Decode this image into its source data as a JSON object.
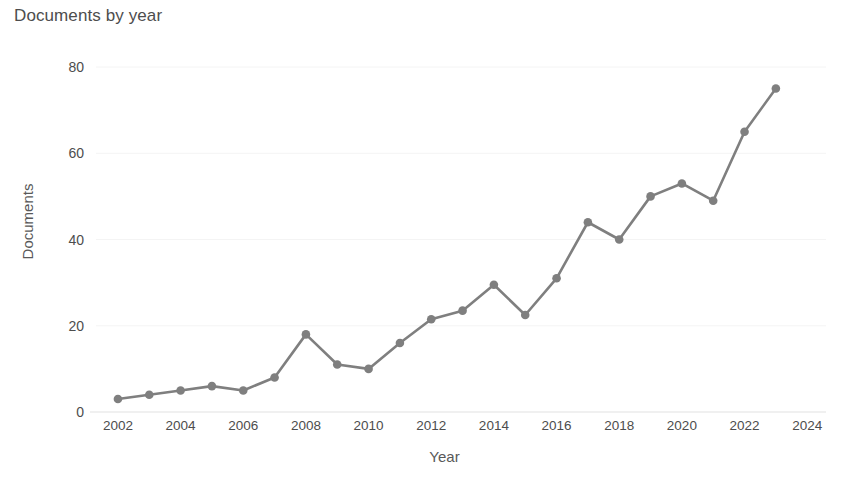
{
  "chart_data": {
    "type": "line",
    "title": "Documents by year",
    "xlabel": "Year",
    "ylabel": "Documents",
    "x": [
      2002,
      2003,
      2004,
      2005,
      2006,
      2007,
      2008,
      2009,
      2010,
      2011,
      2012,
      2013,
      2014,
      2015,
      2016,
      2017,
      2018,
      2019,
      2020,
      2021,
      2022,
      2023
    ],
    "values": [
      3,
      4,
      5,
      6,
      5,
      8,
      18,
      11,
      10,
      16,
      21.5,
      23.5,
      29.5,
      22.5,
      31,
      44,
      40,
      50,
      53,
      49,
      65,
      75
    ],
    "series": [
      {
        "name": "Documents",
        "values": [
          3,
          4,
          5,
          6,
          5,
          8,
          18,
          11,
          10,
          16,
          21.5,
          23.5,
          29.5,
          22.5,
          31,
          44,
          40,
          50,
          53,
          49,
          65,
          75
        ]
      }
    ],
    "xticks": [
      2002,
      2004,
      2006,
      2008,
      2010,
      2012,
      2014,
      2016,
      2018,
      2020,
      2022,
      2024
    ],
    "xtick_labels": [
      "2002",
      "2004",
      "2006",
      "2008",
      "2010",
      "2012",
      "2014",
      "2016",
      "2018",
      "2020",
      "2022",
      "2024"
    ],
    "yticks": [
      0,
      20,
      40,
      60,
      80
    ],
    "ytick_labels": [
      "0",
      "20",
      "40",
      "60",
      "80"
    ],
    "xlim": [
      2001.3,
      2024.6
    ],
    "ylim": [
      0,
      84
    ],
    "grid": true,
    "legend": false,
    "line_color": "#7f7f7f",
    "marker_color": "#7f7f7f",
    "grid_color": "#f4f4f4",
    "axis_color": "#e2e2e2",
    "text_color": "#4d4d4d",
    "background": "#ffffff"
  }
}
